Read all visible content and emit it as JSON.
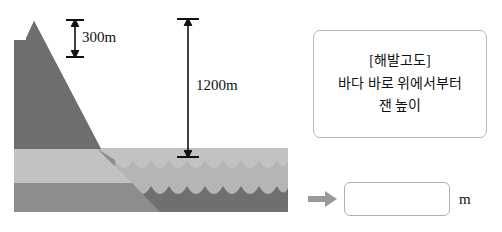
{
  "illustration": {
    "alt_name": "mountain-and-sea-cross-section",
    "colors": {
      "mountain_dark": "#6e6e6e",
      "land_light_band": "#c2c2c2",
      "land_mid_band": "#8d8d8d",
      "sea_light": "#b5b5b5",
      "sea_dark": "#6f6f6f",
      "seabed_dark": "#5d5d5d",
      "arrow": "#111111",
      "background": "#ffffff"
    },
    "dimensions": [
      {
        "id": "peak-height",
        "label": "300m",
        "value": 300,
        "unit": "m",
        "measures": "mountain peak above land surface"
      },
      {
        "id": "sea-level-height",
        "label": "1200m",
        "value": 1200,
        "unit": "m",
        "measures": "peak height above sea level"
      }
    ]
  },
  "definition_box": {
    "title": "[해발고도]",
    "lines": [
      "[해발고도]",
      "바다 바로 위에서부터",
      "잰 높이"
    ]
  },
  "answer": {
    "arrow_icon": "arrow-right-icon",
    "value": "",
    "placeholder": "",
    "unit": "m"
  }
}
